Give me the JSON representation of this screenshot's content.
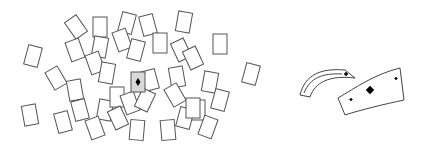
{
  "figure": {
    "highlight_card": {
      "suit": "diamond",
      "fill": "#d9d9d9"
    },
    "cards": [
      [
        76,
        27,
        -35
      ],
      [
        100,
        27,
        0
      ],
      [
        127,
        23,
        15
      ],
      [
        148,
        25,
        -15
      ],
      [
        184,
        22,
        10
      ],
      [
        75,
        50,
        -20
      ],
      [
        100,
        47,
        10
      ],
      [
        122,
        40,
        -20
      ],
      [
        136,
        50,
        15
      ],
      [
        160,
        43,
        0
      ],
      [
        181,
        50,
        -25
      ],
      [
        220,
        44,
        0
      ],
      [
        33,
        56,
        15
      ],
      [
        56,
        78,
        -30
      ],
      [
        95,
        63,
        -20
      ],
      [
        107,
        73,
        10
      ],
      [
        150,
        80,
        -15
      ],
      [
        177,
        77,
        -10
      ],
      [
        193,
        58,
        -25
      ],
      [
        210,
        82,
        10
      ],
      [
        251,
        74,
        15
      ],
      [
        75,
        90,
        -10
      ],
      [
        80,
        110,
        -15
      ],
      [
        105,
        110,
        10
      ],
      [
        117,
        97,
        0
      ],
      [
        130,
        103,
        -20
      ],
      [
        145,
        100,
        25
      ],
      [
        175,
        95,
        -30
      ],
      [
        198,
        110,
        0
      ],
      [
        220,
        100,
        15
      ],
      [
        30,
        115,
        -10
      ],
      [
        63,
        122,
        -15
      ],
      [
        95,
        128,
        -20
      ],
      [
        118,
        118,
        -25
      ],
      [
        137,
        130,
        5
      ],
      [
        168,
        130,
        -5
      ],
      [
        185,
        118,
        15
      ],
      [
        208,
        127,
        20
      ],
      [
        193,
        108,
        0
      ]
    ],
    "bent_card_suit": "diamond"
  }
}
